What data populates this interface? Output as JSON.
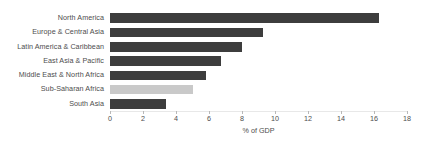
{
  "chart_data": {
    "type": "bar",
    "orientation": "horizontal",
    "title": "",
    "xlabel": "% of GDP",
    "ylabel": "",
    "categories": [
      "North America",
      "Europe & Central Asia",
      "Latin America & Caribbean",
      "East Asia & Pacific",
      "Middle East & North Africa",
      "Sub-Saharan Africa",
      "South Asia"
    ],
    "values": [
      16.3,
      9.3,
      8.0,
      6.7,
      5.8,
      5.0,
      3.4
    ],
    "xlim": [
      0,
      18
    ],
    "xticks": [
      0,
      2,
      4,
      6,
      8,
      10,
      12,
      14,
      16,
      18
    ],
    "xtick_labels": [
      "0",
      "2",
      "4",
      "6",
      "8",
      "10",
      "12",
      "14",
      "16",
      "18"
    ],
    "grid": false,
    "legend": null,
    "bar_color": "#3d3d3d",
    "highlight_color": "#c9c9c9",
    "highlight_category": "Sub-Saharan Africa",
    "text_color": "#4d4d4d",
    "background": "#ffffff"
  }
}
